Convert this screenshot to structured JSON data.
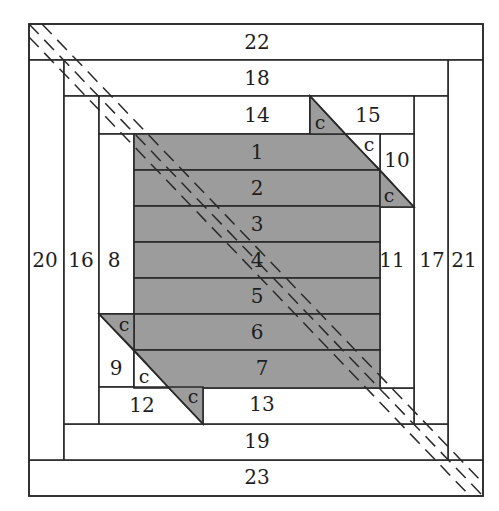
{
  "diagram": {
    "colors": {
      "center_fill": "#9c9c9c",
      "piece_fill": "#ffffff",
      "line": "#2a2a2a"
    },
    "center_strips": [
      "1",
      "2",
      "3",
      "4",
      "5",
      "6",
      "7"
    ],
    "pieces": {
      "p8": "8",
      "p9": "9",
      "p10": "10",
      "p11": "11",
      "p12": "12",
      "p13": "13",
      "p14": "14",
      "p15": "15",
      "p16": "16",
      "p17": "17",
      "p18": "18",
      "p19": "19",
      "p20": "20",
      "p21": "21",
      "p22": "22",
      "p23": "23"
    },
    "corner_label": "c",
    "dashed_band": "diagonal cut line from top-left to bottom-right"
  }
}
